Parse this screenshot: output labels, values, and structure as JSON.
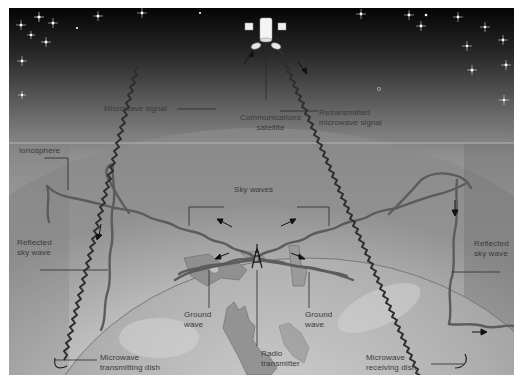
{
  "diagram": {
    "style": "grayscale",
    "labels": {
      "microwave_signal": "Microwave signal",
      "communications_satellite": "Communications\nsatellite",
      "retransmitted_signal": "Retransmitted\nmicrowave signal",
      "ionosphere": "Ionosphere",
      "sky_waves": "Sky waves",
      "reflected_sky_wave_left": "Reflected\nsky wave",
      "reflected_sky_wave_right": "Reflected\nsky wave",
      "ground_wave_left": "Ground\nwave",
      "ground_wave_right": "Ground\nwave",
      "radio_transmitter": "Radio\ntransmitter",
      "microwave_transmitting_dish": "Microwave\ntransmitting dish",
      "microwave_receiving_dish": "Microwave\nreceiving dish"
    },
    "colors": {
      "space_top": "#0a0a0a",
      "space_bottom": "#8a8a8a",
      "ionosphere_band": "#9a9a9a",
      "atmosphere": "#c4c4c4",
      "earth": "#b8b8b8",
      "land": "#8e8e8e",
      "wave": "#5a5a5a",
      "microwave": "#333333",
      "label_text": "#3a3a3a"
    }
  }
}
